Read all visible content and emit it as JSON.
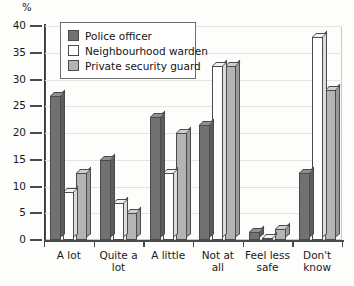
{
  "chart_data": {
    "type": "bar",
    "title": "",
    "subtitle": "",
    "xlabel": "",
    "ylabel": "%",
    "ylim": [
      0,
      40
    ],
    "yticks": [
      0,
      5,
      10,
      15,
      20,
      25,
      30,
      35,
      40
    ],
    "grid": true,
    "legend_position": "top-left",
    "categories": [
      "A lot",
      "Quite a\nlot",
      "A little",
      "Not at\nall",
      "Feel less\nsafe",
      "Don't\nknow"
    ],
    "series": [
      {
        "name": "Police officer",
        "color": "#717171",
        "values": [
          27,
          15,
          23,
          21.5,
          1.5,
          12.5
        ]
      },
      {
        "name": "Neighbourhood warden",
        "color": "#ffffff",
        "values": [
          9,
          7,
          12.5,
          32.5,
          0.3,
          38
        ]
      },
      {
        "name": "Private security guard",
        "color": "#b4b4b4",
        "values": [
          12.5,
          5,
          20,
          32.5,
          2,
          28
        ]
      }
    ]
  },
  "axis": {
    "unit_label": "%",
    "tick_labels": [
      "0",
      "5",
      "10",
      "15",
      "20",
      "25",
      "30",
      "35",
      "40"
    ]
  },
  "legend": {
    "items": [
      {
        "label": "Police officer",
        "swatch": "legend-swatch-police"
      },
      {
        "label": "Neighbourhood warden",
        "swatch": "legend-swatch-warden"
      },
      {
        "label": "Private security guard",
        "swatch": "legend-swatch-guard"
      }
    ]
  }
}
